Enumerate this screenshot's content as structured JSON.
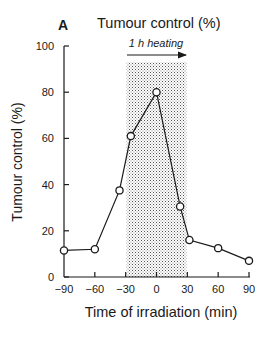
{
  "panel_label": "A",
  "title": "Tumour control (%)",
  "annotation": "1 h heating",
  "chart_data": {
    "type": "line",
    "title": "Tumour control (%)",
    "xlabel": "Time of irradiation (min)",
    "ylabel": "Tumour control (%)",
    "xlim": [
      -90,
      90
    ],
    "ylim": [
      0,
      100
    ],
    "xticks": [
      -90,
      -60,
      -30,
      0,
      30,
      60,
      90
    ],
    "yticks": [
      0,
      20,
      40,
      60,
      80,
      100
    ],
    "xtick_labels": [
      "−90",
      "−60",
      "−30",
      "0",
      "30",
      "60",
      "90"
    ],
    "ytick_labels": [
      "0",
      "20",
      "40",
      "60",
      "80",
      "100"
    ],
    "grid": false,
    "shaded_region": {
      "x": [
        -29,
        29
      ],
      "y_top": 93,
      "label": "1 h heating"
    },
    "series": [
      {
        "name": "Tumour control",
        "marker": "open-circle",
        "x": [
          -90,
          -60,
          -36,
          -25,
          0,
          23,
          32,
          60,
          90
        ],
        "y": [
          11.5,
          12,
          37.5,
          61,
          80,
          30.5,
          16,
          12.5,
          7
        ]
      }
    ]
  }
}
